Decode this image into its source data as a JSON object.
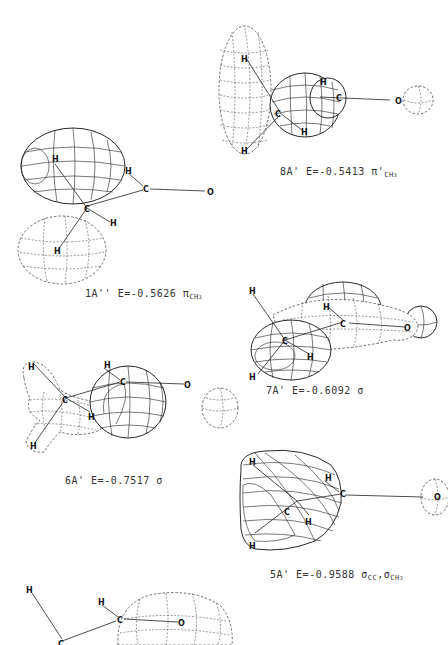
{
  "figure": {
    "molecule_atoms": [
      "H",
      "C",
      "O"
    ],
    "orbitals": [
      {
        "id": "8A'",
        "label": "8A'",
        "energy_text": "E=-0.5413",
        "character": "π'",
        "character_sub": "CH",
        "character_sub2": "3"
      },
      {
        "id": "1A''",
        "label": "1A''",
        "energy_text": "E=-0.5626",
        "character": "π",
        "character_sub": "CH",
        "character_sub2": "3"
      },
      {
        "id": "7A'",
        "label": "7A'",
        "energy_text": "E=-0.6092",
        "character": "σ",
        "character_sub": "",
        "character_sub2": ""
      },
      {
        "id": "6A'",
        "label": "6A'",
        "energy_text": "E=-0.7517",
        "character": "σ",
        "character_sub": "",
        "character_sub2": ""
      },
      {
        "id": "5A'",
        "label": "5A'",
        "energy_text": "E=-0.9588",
        "character": "σ",
        "character_sub": "CC",
        "character_extra": ",σ",
        "character_sub3": "CH",
        "character_sub4": "3"
      }
    ]
  },
  "atom_labels": {
    "H": "H",
    "C": "C",
    "O": "O"
  }
}
